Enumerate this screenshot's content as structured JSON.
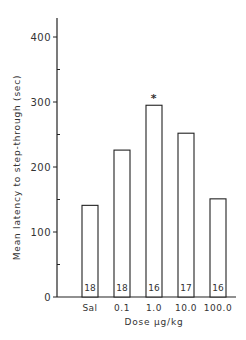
{
  "chart_data": {
    "type": "bar",
    "title": "",
    "xlabel": "Dose µg/kg",
    "ylabel": "Mean latency to step-through (sec)",
    "categories": [
      "Sal",
      "0.1",
      "1.0",
      "10.0",
      "100.0"
    ],
    "values": [
      141,
      226,
      295,
      252,
      151
    ],
    "n_labels": [
      "18",
      "18",
      "16",
      "17",
      "16"
    ],
    "annotations": [
      {
        "category": "1.0",
        "text": "*"
      }
    ],
    "ylim": [
      0,
      420
    ],
    "yticks": [
      0,
      100,
      200,
      300,
      400
    ],
    "grid": false,
    "legend": null
  },
  "axis": {
    "ytick_labels": [
      "0",
      "100",
      "200",
      "300",
      "400"
    ]
  }
}
